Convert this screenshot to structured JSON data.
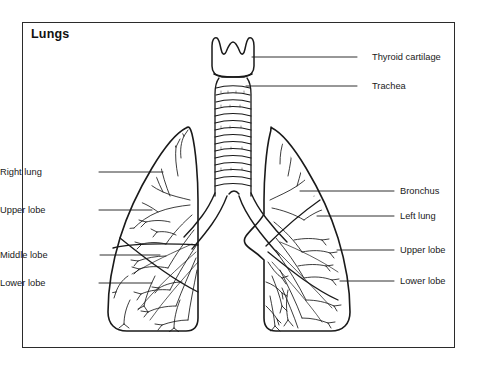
{
  "figure": {
    "title": "Lungs",
    "border_color": "#2b2b2b",
    "ink_color": "#1a1a1a",
    "background": "#ffffff"
  },
  "labels_left": [
    {
      "name": "right-lung",
      "text": "Right lung",
      "text_x": 28,
      "text_y": 168,
      "line_x1": 99,
      "line_y1": 172,
      "line_x2": 163,
      "line_y2": 172
    },
    {
      "name": "upper-lobe-right",
      "text": "Upper lobe",
      "text_x": 28,
      "text_y": 206,
      "line_x1": 99,
      "line_y1": 210,
      "line_x2": 152,
      "line_y2": 210
    },
    {
      "name": "middle-lobe",
      "text": "Middle lobe",
      "text_x": 24,
      "text_y": 251,
      "line_x1": 100,
      "line_y1": 255,
      "line_x2": 160,
      "line_y2": 255
    },
    {
      "name": "lower-lobe-right",
      "text": "Lower lobe",
      "text_x": 28,
      "text_y": 279,
      "line_x1": 99,
      "line_y1": 283,
      "line_x2": 152,
      "line_y2": 283
    }
  ],
  "labels_right": [
    {
      "name": "thyroid-cartilage",
      "text": "Thyroid cartilage",
      "text_x": 372,
      "text_y": 53,
      "line_x1": 357,
      "line_y1": 57,
      "line_x2": 252,
      "line_y2": 57
    },
    {
      "name": "trachea",
      "text": "Trachea",
      "text_x": 372,
      "text_y": 82,
      "line_x1": 357,
      "line_y1": 86,
      "line_x2": 246,
      "line_y2": 86
    },
    {
      "name": "bronchus",
      "text": "Bronchus",
      "text_x": 400,
      "text_y": 187,
      "line_x1": 394,
      "line_y1": 191,
      "line_x2": 300,
      "line_y2": 191
    },
    {
      "name": "left-lung",
      "text": "Left lung",
      "text_x": 400,
      "text_y": 212,
      "line_x1": 394,
      "line_y1": 216,
      "line_x2": 317,
      "line_y2": 216
    },
    {
      "name": "upper-lobe-left",
      "text": "Upper lobe",
      "text_x": 400,
      "text_y": 246,
      "line_x1": 394,
      "line_y1": 250,
      "line_x2": 337,
      "line_y2": 250
    },
    {
      "name": "lower-lobe-left",
      "text": "Lower lobe",
      "text_x": 400,
      "text_y": 277,
      "line_x1": 394,
      "line_y1": 281,
      "line_x2": 340,
      "line_y2": 281
    }
  ],
  "anatomy": {
    "thyroid_cartilage": "notched shield-shaped cartilage at top of airway",
    "trachea": "vertical tube with horizontal cartilage rings",
    "trachea_ring_count": 15,
    "carina": "bifurcation of trachea into two main bronchi",
    "right_lung_lobes": 3,
    "left_lung_lobes": 2,
    "left_lung_feature": "cardiac notch on medial border"
  }
}
